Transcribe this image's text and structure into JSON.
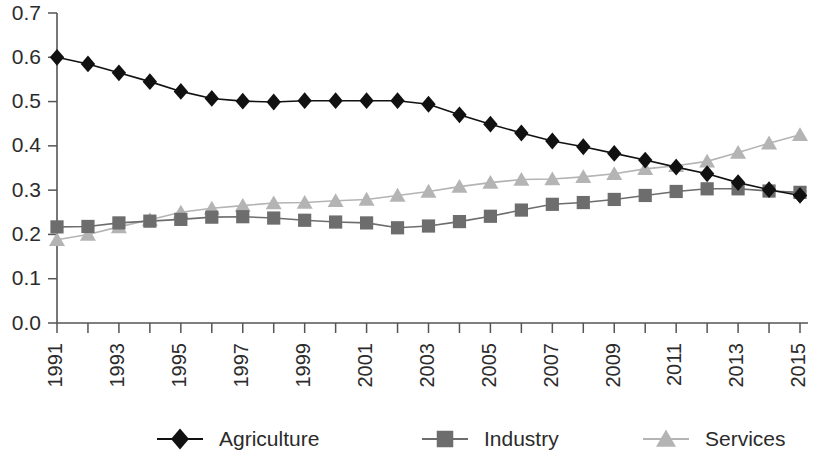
{
  "chart_data": {
    "type": "line",
    "title": "",
    "subtitle": "",
    "xlabel": "",
    "ylabel": "",
    "xlim": [
      1991,
      2015
    ],
    "ylim": [
      0.0,
      0.7
    ],
    "grid": false,
    "legend_position": "bottom",
    "x": [
      1991,
      1992,
      1993,
      1994,
      1995,
      1996,
      1997,
      1998,
      1999,
      2000,
      2001,
      2002,
      2003,
      2004,
      2005,
      2006,
      2007,
      2008,
      2009,
      2010,
      2011,
      2012,
      2013,
      2014,
      2015
    ],
    "x_tick_labels": [
      "1991",
      "1993",
      "1995",
      "1997",
      "1999",
      "2001",
      "2003",
      "2005",
      "2007",
      "2009",
      "2011",
      "2013",
      "2015"
    ],
    "y_tick_labels": [
      "0.0",
      "0.1",
      "0.2",
      "0.3",
      "0.4",
      "0.5",
      "0.6",
      "0.7"
    ],
    "y_ticks": [
      0.0,
      0.1,
      0.2,
      0.3,
      0.4,
      0.5,
      0.6,
      0.7
    ],
    "series": [
      {
        "name": "Agriculture",
        "color": "#111111",
        "marker": "diamond",
        "values": [
          0.6,
          0.585,
          0.565,
          0.545,
          0.523,
          0.507,
          0.501,
          0.499,
          0.502,
          0.502,
          0.502,
          0.502,
          0.494,
          0.47,
          0.449,
          0.429,
          0.411,
          0.398,
          0.383,
          0.368,
          0.352,
          0.337,
          0.317,
          0.301,
          0.288
        ]
      },
      {
        "name": "Industry",
        "color": "#6d6d6d",
        "marker": "square",
        "values": [
          0.217,
          0.218,
          0.226,
          0.23,
          0.234,
          0.239,
          0.24,
          0.237,
          0.232,
          0.228,
          0.226,
          0.215,
          0.219,
          0.229,
          0.241,
          0.255,
          0.268,
          0.272,
          0.279,
          0.288,
          0.297,
          0.303,
          0.303,
          0.298,
          0.295
        ]
      },
      {
        "name": "Services",
        "color": "#b4b4b4",
        "marker": "triangle",
        "values": [
          0.188,
          0.2,
          0.217,
          0.233,
          0.25,
          0.259,
          0.265,
          0.271,
          0.272,
          0.276,
          0.279,
          0.288,
          0.297,
          0.308,
          0.317,
          0.324,
          0.325,
          0.33,
          0.337,
          0.348,
          0.355,
          0.365,
          0.385,
          0.406,
          0.425
        ]
      }
    ]
  },
  "legend": {
    "entries": [
      {
        "label": "Agriculture",
        "marker": "diamond-icon",
        "color": "#111111"
      },
      {
        "label": "Industry",
        "marker": "square-icon",
        "color": "#6d6d6d"
      },
      {
        "label": "Services",
        "marker": "triangle-icon",
        "color": "#b4b4b4"
      }
    ]
  },
  "colors": {
    "agriculture": "#111111",
    "industry": "#6d6d6d",
    "services": "#b4b4b4",
    "axis": "#555555",
    "text": "#2b2b2b",
    "background": "#ffffff"
  }
}
